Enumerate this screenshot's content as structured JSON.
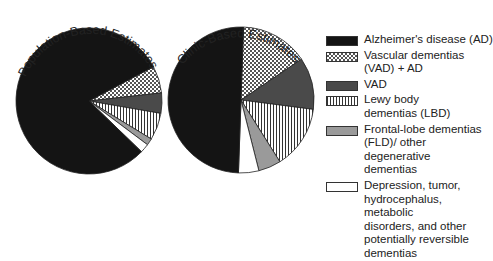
{
  "chart_data": [
    {
      "type": "pie",
      "title": "Population-Based Estimates",
      "categories": [
        "Alzheimer's disease (AD)",
        "Vascular dementias (VAD) + AD",
        "VAD",
        "Lewy body dementias (LBD)",
        "Frontal-lobe dementias (FLD)/ other degenerative dementias",
        "Depression, tumor, hydrocephalus, metabolic disorders, and other potentially reversible dementias"
      ],
      "values": [
        80,
        6,
        4.5,
        6,
        1.5,
        2
      ],
      "start_angle_deg": 62
    },
    {
      "type": "pie",
      "title": "Clinic-Based Estimates",
      "categories": [
        "Alzheimer's disease (AD)",
        "Vascular dementias (VAD) + AD",
        "VAD",
        "Lewy body dementias (LBD)",
        "Frontal-lobe dementias (FLD)/ other degenerative dementias",
        "Depression, tumor, hydrocephalus, metabolic disorders, and other potentially reversible dementias"
      ],
      "values": [
        50,
        15,
        11.5,
        14,
        5,
        4.5
      ],
      "start_angle_deg": 2
    }
  ],
  "legend": {
    "position": "right",
    "items": [
      {
        "label": "Alzheimer's disease (AD)",
        "fill": "solid-black"
      },
      {
        "label": "Vascular dementias\n(VAD) + AD",
        "fill": "crosshatch"
      },
      {
        "label": "VAD",
        "fill": "dark-gray"
      },
      {
        "label": "Lewy body\ndementias (LBD)",
        "fill": "vertical-stripes"
      },
      {
        "label": "Frontal-lobe dementias\n(FLD)/ other degenerative\ndementias",
        "fill": "medium-gray"
      },
      {
        "label": "Depression, tumor,\nhydrocephalus, metabolic\ndisorders, and other\npotentially reversible\ndementias",
        "fill": "white"
      }
    ]
  },
  "colors": {
    "ad": "#141414",
    "vad": "#4a4a4a",
    "fld": "#9a9a9a",
    "other": "#ffffff",
    "stroke": "#222222"
  }
}
